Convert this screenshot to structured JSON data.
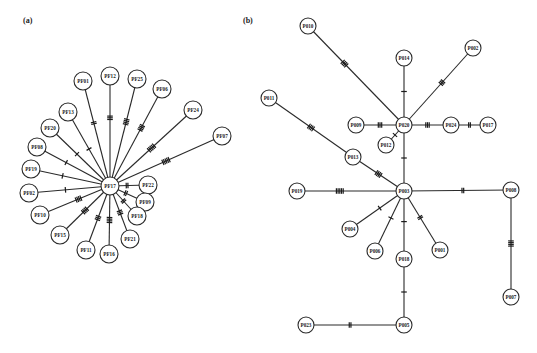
{
  "panels": [
    {
      "label": "(a)",
      "label_pos": [
        23,
        22
      ],
      "center": "PF17",
      "nodes": [
        {
          "id": "PF17",
          "x": 110,
          "y": 186,
          "r": 9
        },
        {
          "id": "PF01",
          "x": 83,
          "y": 81,
          "r": 9
        },
        {
          "id": "PF12",
          "x": 110,
          "y": 76,
          "r": 9
        },
        {
          "id": "PF25",
          "x": 137,
          "y": 79,
          "r": 9
        },
        {
          "id": "PF06",
          "x": 162,
          "y": 89,
          "r": 9
        },
        {
          "id": "PF24",
          "x": 193,
          "y": 110,
          "r": 9
        },
        {
          "id": "PF07",
          "x": 222,
          "y": 136,
          "r": 9
        },
        {
          "id": "PF13",
          "x": 68,
          "y": 112,
          "r": 9
        },
        {
          "id": "PF20",
          "x": 50,
          "y": 128,
          "r": 9
        },
        {
          "id": "PF08",
          "x": 37,
          "y": 147,
          "r": 9
        },
        {
          "id": "PF19",
          "x": 31,
          "y": 169,
          "r": 9
        },
        {
          "id": "PF02",
          "x": 29,
          "y": 193,
          "r": 9
        },
        {
          "id": "PF22",
          "x": 148,
          "y": 185,
          "r": 9
        },
        {
          "id": "PF09",
          "x": 145,
          "y": 202,
          "r": 9
        },
        {
          "id": "PF10",
          "x": 40,
          "y": 215,
          "r": 9
        },
        {
          "id": "PF18",
          "x": 137,
          "y": 216,
          "r": 9
        },
        {
          "id": "PF15",
          "x": 60,
          "y": 235,
          "r": 9
        },
        {
          "id": "PF21",
          "x": 130,
          "y": 239,
          "r": 9
        },
        {
          "id": "PF11",
          "x": 86,
          "y": 250,
          "r": 9
        },
        {
          "id": "PF16",
          "x": 109,
          "y": 254,
          "r": 9
        }
      ],
      "edges": [
        {
          "a": "PF17",
          "b": "PF01",
          "ticks": 2,
          "t": 0.6
        },
        {
          "a": "PF17",
          "b": "PF12",
          "ticks": 3,
          "t": 0.62
        },
        {
          "a": "PF17",
          "b": "PF25",
          "ticks": 4,
          "t": 0.6
        },
        {
          "a": "PF17",
          "b": "PF06",
          "ticks": 4,
          "t": 0.6
        },
        {
          "a": "PF17",
          "b": "PF24",
          "ticks": 5,
          "t": 0.5
        },
        {
          "a": "PF17",
          "b": "PF07",
          "ticks": 5,
          "t": 0.5
        },
        {
          "a": "PF17",
          "b": "PF13",
          "ticks": 1,
          "t": 0.5
        },
        {
          "a": "PF17",
          "b": "PF20",
          "ticks": 1,
          "t": 0.55
        },
        {
          "a": "PF17",
          "b": "PF08",
          "ticks": 1,
          "t": 0.6
        },
        {
          "a": "PF17",
          "b": "PF19",
          "ticks": 1,
          "t": 0.6
        },
        {
          "a": "PF17",
          "b": "PF02",
          "ticks": 1,
          "t": 0.55
        },
        {
          "a": "PF17",
          "b": "PF22",
          "ticks": 2,
          "t": 0.45
        },
        {
          "a": "PF17",
          "b": "PF09",
          "ticks": 2,
          "t": 0.45
        },
        {
          "a": "PF17",
          "b": "PF18",
          "ticks": 2,
          "t": 0.5
        },
        {
          "a": "PF17",
          "b": "PF10",
          "ticks": 4,
          "t": 0.45
        },
        {
          "a": "PF17",
          "b": "PF15",
          "ticks": 4,
          "t": 0.5
        },
        {
          "a": "PF17",
          "b": "PF21",
          "ticks": 3,
          "t": 0.5
        },
        {
          "a": "PF17",
          "b": "PF11",
          "ticks": 3,
          "t": 0.5
        },
        {
          "a": "PF17",
          "b": "PF16",
          "ticks": 4,
          "t": 0.5
        }
      ]
    },
    {
      "label": "(b)",
      "label_pos": [
        243,
        22
      ],
      "center": "P003",
      "nodes": [
        {
          "id": "P020",
          "x": 404,
          "y": 125,
          "r": 8
        },
        {
          "id": "P003",
          "x": 404,
          "y": 191,
          "r": 8
        },
        {
          "id": "P010",
          "x": 308,
          "y": 26,
          "r": 8
        },
        {
          "id": "P014",
          "x": 404,
          "y": 58,
          "r": 8
        },
        {
          "id": "P002",
          "x": 473,
          "y": 48,
          "r": 8
        },
        {
          "id": "P011",
          "x": 269,
          "y": 98,
          "r": 8
        },
        {
          "id": "P009",
          "x": 356,
          "y": 125,
          "r": 8
        },
        {
          "id": "P024",
          "x": 451,
          "y": 125,
          "r": 8
        },
        {
          "id": "P017",
          "x": 488,
          "y": 125,
          "r": 8
        },
        {
          "id": "P012",
          "x": 386,
          "y": 145,
          "r": 8
        },
        {
          "id": "P013",
          "x": 353,
          "y": 157,
          "r": 8
        },
        {
          "id": "P019",
          "x": 297,
          "y": 191,
          "r": 8
        },
        {
          "id": "P008",
          "x": 511,
          "y": 190,
          "r": 8
        },
        {
          "id": "P004",
          "x": 350,
          "y": 229,
          "r": 8
        },
        {
          "id": "P006",
          "x": 375,
          "y": 251,
          "r": 8
        },
        {
          "id": "P018",
          "x": 404,
          "y": 259,
          "r": 8
        },
        {
          "id": "P001",
          "x": 440,
          "y": 250,
          "r": 8
        },
        {
          "id": "P007",
          "x": 511,
          "y": 297,
          "r": 8
        },
        {
          "id": "P005",
          "x": 404,
          "y": 325,
          "r": 8
        },
        {
          "id": "P023",
          "x": 306,
          "y": 325,
          "r": 8
        }
      ],
      "edges": [
        {
          "a": "P020",
          "b": "P010",
          "ticks": 4,
          "t": 0.62
        },
        {
          "a": "P020",
          "b": "P014",
          "ticks": 1,
          "t": 0.5
        },
        {
          "a": "P020",
          "b": "P002",
          "ticks": 3,
          "t": 0.55
        },
        {
          "a": "P020",
          "b": "P009",
          "ticks": 3,
          "t": 0.5
        },
        {
          "a": "P020",
          "b": "P024",
          "ticks": 3,
          "t": 0.5
        },
        {
          "a": "P024",
          "b": "P017",
          "ticks": 2,
          "t": 0.5
        },
        {
          "a": "P020",
          "b": "P012",
          "ticks": 1,
          "t": 0.5
        },
        {
          "a": "P020",
          "b": "P003",
          "ticks": 1,
          "t": 0.5
        },
        {
          "a": "P003",
          "b": "P013",
          "ticks": 4,
          "t": 0.5
        },
        {
          "a": "P013",
          "b": "P011",
          "ticks": 4,
          "t": 0.5
        },
        {
          "a": "P003",
          "b": "P019",
          "ticks": 5,
          "t": 0.6
        },
        {
          "a": "P003",
          "b": "P008",
          "ticks": 2,
          "t": 0.55
        },
        {
          "a": "P008",
          "b": "P007",
          "ticks": 4,
          "t": 0.5
        },
        {
          "a": "P003",
          "b": "P004",
          "ticks": 1,
          "t": 0.45
        },
        {
          "a": "P003",
          "b": "P006",
          "ticks": 1,
          "t": 0.45
        },
        {
          "a": "P003",
          "b": "P018",
          "ticks": 1,
          "t": 0.45
        },
        {
          "a": "P003",
          "b": "P001",
          "ticks": 2,
          "t": 0.45
        },
        {
          "a": "P018",
          "b": "P005",
          "ticks": 1,
          "t": 0.5
        },
        {
          "a": "P005",
          "b": "P023",
          "ticks": 2,
          "t": 0.55
        }
      ]
    }
  ]
}
